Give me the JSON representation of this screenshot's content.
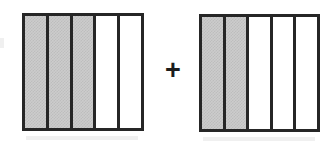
{
  "figure": {
    "background_color": "#ffffff",
    "outline_color": "#262626",
    "shade_color": "#cccccc",
    "operator": "+",
    "operator_name": "plus-sign",
    "expression": "3/5 + 2/5"
  },
  "bars": [
    {
      "name": "left-fraction-bar",
      "label": "3/5",
      "total_parts": 5,
      "shaded_parts": 3,
      "cells": [
        {
          "index": 1,
          "shaded": true
        },
        {
          "index": 2,
          "shaded": true
        },
        {
          "index": 3,
          "shaded": true
        },
        {
          "index": 4,
          "shaded": false
        },
        {
          "index": 5,
          "shaded": false
        }
      ]
    },
    {
      "name": "right-fraction-bar",
      "label": "2/5",
      "total_parts": 5,
      "shaded_parts": 2,
      "cells": [
        {
          "index": 1,
          "shaded": true
        },
        {
          "index": 2,
          "shaded": true
        },
        {
          "index": 3,
          "shaded": false
        },
        {
          "index": 4,
          "shaded": false
        },
        {
          "index": 5,
          "shaded": false
        }
      ]
    }
  ],
  "chart_data": {
    "type": "bar",
    "xlabel": "",
    "ylabel": "",
    "categories": [
      "left bar (3/5)",
      "right bar (2/5)"
    ],
    "values": [
      0.6,
      0.4
    ],
    "series": [
      {
        "name": "shaded parts",
        "values": [
          3,
          2
        ]
      },
      {
        "name": "unshaded parts",
        "values": [
          2,
          3
        ]
      },
      {
        "name": "total parts",
        "values": [
          5,
          5
        ]
      }
    ],
    "annotations": [
      "+"
    ],
    "grid": false,
    "legend": "none"
  }
}
